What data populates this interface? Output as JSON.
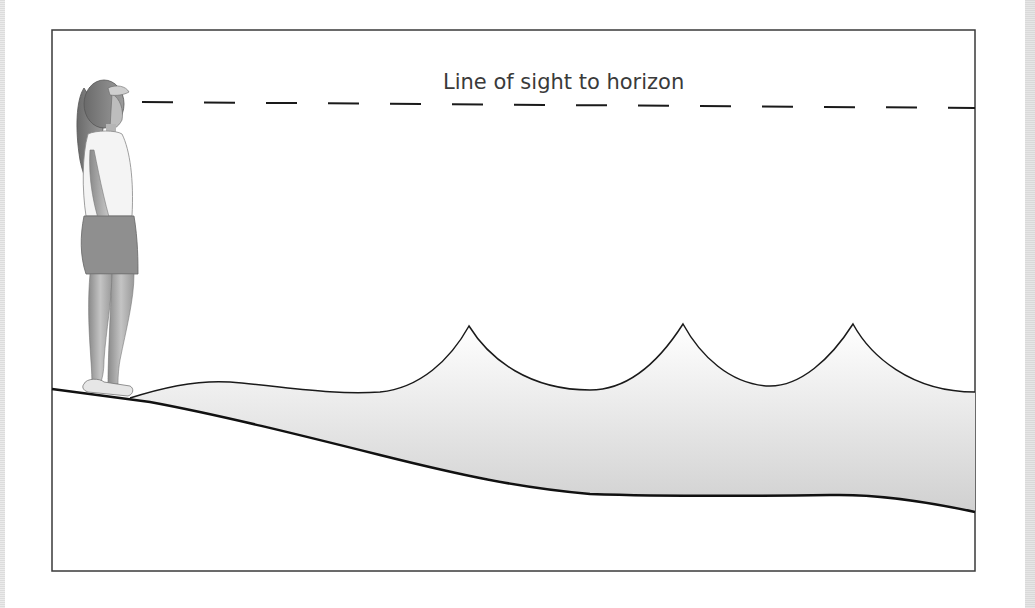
{
  "diagram": {
    "title": "Line of sight to horizon",
    "elements": {
      "observer": "girl standing on shore shading eyes, looking toward horizon",
      "sight_line": "dashed horizontal line from observer's eye to right edge",
      "waves": "three cusp-shaped wave crests on the water surface",
      "ground": "sloping shoreline / seabed curve"
    },
    "colors": {
      "frame": "#3a3a3a",
      "line": "#1a1a1a",
      "text": "#3a3a3a",
      "water_gradient_top": "#ffffff",
      "water_gradient_bottom": "#d4d4d4"
    }
  }
}
